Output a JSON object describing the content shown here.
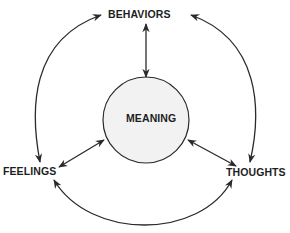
{
  "diagram": {
    "center": {
      "label": "MEANING",
      "fill": "#f2f2f2",
      "stroke": "#2a2a2a"
    },
    "nodes": [
      {
        "id": "behaviors",
        "label": "BEHAVIORS"
      },
      {
        "id": "feelings",
        "label": "FEELINGS"
      },
      {
        "id": "thoughts",
        "label": "THOUGHTS"
      }
    ],
    "edges": [
      {
        "from": "MEANING",
        "to": "BEHAVIORS",
        "type": "bidirectional"
      },
      {
        "from": "MEANING",
        "to": "FEELINGS",
        "type": "bidirectional"
      },
      {
        "from": "MEANING",
        "to": "THOUGHTS",
        "type": "bidirectional"
      },
      {
        "from": "FEELINGS",
        "to": "BEHAVIORS",
        "type": "bidirectional-arc"
      },
      {
        "from": "BEHAVIORS",
        "to": "THOUGHTS",
        "type": "bidirectional-arc"
      },
      {
        "from": "FEELINGS",
        "to": "THOUGHTS",
        "type": "bidirectional-arc"
      }
    ],
    "line_color": "#2a2a2a"
  }
}
